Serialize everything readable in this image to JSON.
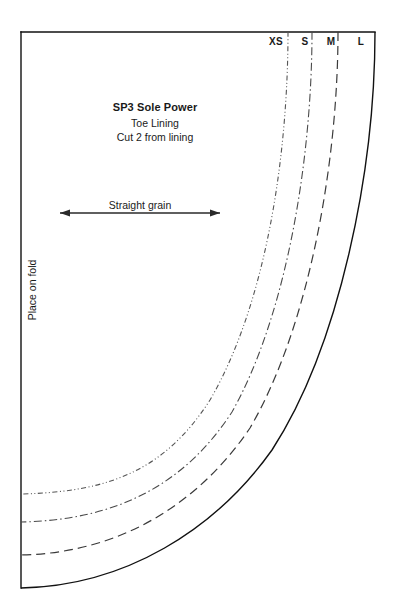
{
  "document": {
    "type": "sewing-pattern-piece",
    "background_color": "#ffffff",
    "ink_color": "#1a1a1a",
    "width": 395,
    "height": 615
  },
  "title_block": {
    "pattern_name": "SP3 Sole Power",
    "piece_name": "Toe Lining",
    "cut_instruction": "Cut 2 from lining"
  },
  "grain": {
    "label": "Straight grain",
    "arrow_start_x": 60,
    "arrow_end_x": 220,
    "arrow_y": 213
  },
  "fold": {
    "label": "Place on fold",
    "edge_x": 21,
    "edge_top_y": 32,
    "edge_bottom_y": 588
  },
  "top_edge": {
    "y": 32,
    "start_x": 21,
    "end_x": 375
  },
  "sizes": [
    {
      "code": "XS",
      "label_x": 276,
      "label_y": 37,
      "line_style": "dash-dot-dot",
      "dash_array": "5,2.5,1,2.5,1,2.5",
      "stroke_color": "#555555",
      "stroke_width": 1.1,
      "top_x": 288,
      "left_end_y": 494
    },
    {
      "code": "S",
      "label_x": 305,
      "label_y": 37,
      "line_style": "dash-dot",
      "dash_array": "8,3,1.5,3",
      "stroke_color": "#4a4a4a",
      "stroke_width": 1.1,
      "top_x": 312,
      "left_end_y": 522
    },
    {
      "code": "M",
      "label_x": 331,
      "label_y": 37,
      "line_style": "dashed",
      "dash_array": "9,5",
      "stroke_color": "#3a3a3a",
      "stroke_width": 1.2,
      "top_x": 338,
      "left_end_y": 555
    },
    {
      "code": "L",
      "label_x": 361,
      "label_y": 37,
      "line_style": "solid",
      "dash_array": "none",
      "stroke_color": "#111111",
      "stroke_width": 1.4,
      "top_x": 375,
      "left_end_y": 588
    }
  ],
  "curve_paths": {
    "XS": "M 288 32 C 288 150 268 300 210 400 C 165 470 110 492 21 494",
    "S": "M 312 32 C 312 155 288 312 232 412 C 185 484 118 520 21 522",
    "M": "M 338 32 C 338 160 310 325 250 428 C 200 502 122 553 21 555",
    "L": "M 375 32 C 375 170 340 345 272 450 C 215 530 125 586 21 588"
  }
}
